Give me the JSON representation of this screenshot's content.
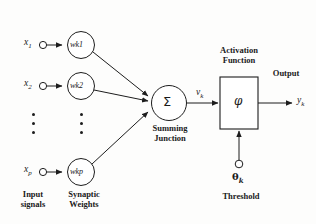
{
  "diagram": {
    "type": "neural-network-neuron-model",
    "inputs": [
      {
        "label": "x",
        "sub": "1"
      },
      {
        "label": "x",
        "sub": "2"
      },
      {
        "label": "x",
        "sub": "p"
      }
    ],
    "weights": [
      {
        "label": "w",
        "sub": "k1",
        "text": "wk1"
      },
      {
        "label": "w",
        "sub": "k2",
        "text": "wk2"
      },
      {
        "label": "w",
        "sub": "kp",
        "text": "wkp"
      }
    ],
    "summing_junction": {
      "symbol": "Σ",
      "caption_line1": "Summing",
      "caption_line2": "Junction",
      "output_signal": "v",
      "output_signal_sub": "k"
    },
    "activation": {
      "caption_line1": "Activation",
      "caption_line2": "Function",
      "symbol": "φ"
    },
    "threshold": {
      "symbol": "θ",
      "sub": "k",
      "caption": "Threshold"
    },
    "output": {
      "caption": "Output",
      "label": "y",
      "sub": "k"
    },
    "captions": {
      "input_signals_line1": "Input",
      "input_signals_line2": "signals",
      "synaptic_weights_line1": "Synaptic",
      "synaptic_weights_line2": "Weights"
    },
    "ellipsis_marker": "⋮",
    "colors": {
      "stroke": "#1d1d1d",
      "text": "#1a1a1a",
      "background": "#fdfdfc"
    }
  }
}
